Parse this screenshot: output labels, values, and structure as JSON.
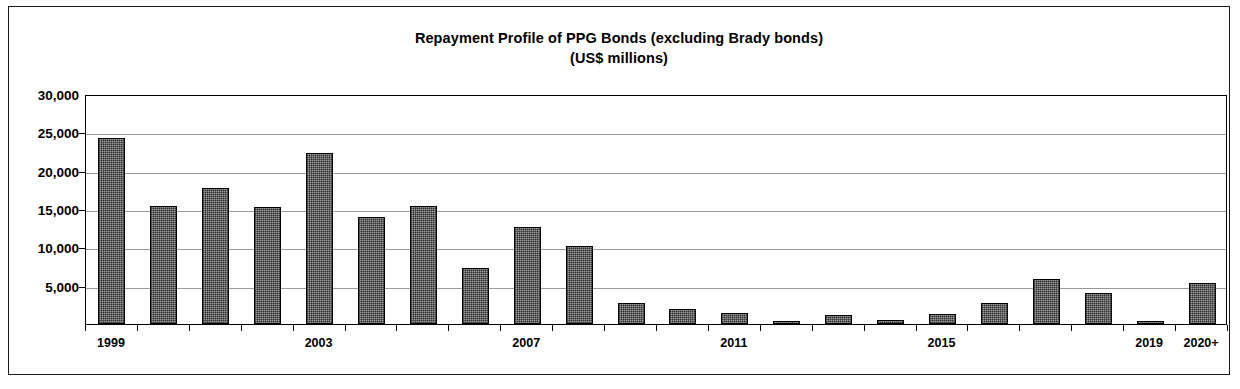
{
  "chart_data": {
    "type": "bar",
    "title": "Repayment Profile of PPG Bonds (excluding Brady bonds)",
    "subtitle": "(US$ millions)",
    "xlabel": "",
    "ylabel": "",
    "ylim": [
      0,
      30000
    ],
    "ytick_labels": [
      "30,000",
      "25,000",
      "20,000",
      "15,000",
      "10,000",
      "5,000"
    ],
    "ytick_values": [
      30000,
      25000,
      20000,
      15000,
      10000,
      5000
    ],
    "grid": true,
    "legend": false,
    "bar_color": "#9d9d9d",
    "bar_edge_color": "#000000",
    "categories": [
      "1999",
      "2000",
      "2001",
      "2002",
      "2003",
      "2004",
      "2005",
      "2006",
      "2007",
      "2008",
      "2009",
      "2010",
      "2011",
      "2012",
      "2013",
      "2014",
      "2015",
      "2016",
      "2017",
      "2018",
      "2019",
      "2020+"
    ],
    "values": [
      24300,
      15400,
      17700,
      15200,
      22300,
      13900,
      15400,
      7300,
      12600,
      10200,
      2800,
      1900,
      1400,
      400,
      1200,
      500,
      1300,
      2700,
      5900,
      4000,
      300,
      5300
    ],
    "xtick_labels": [
      "1999",
      "2003",
      "2007",
      "2011",
      "2015",
      "2019",
      "2020+"
    ],
    "xtick_categories": [
      "1999",
      "2003",
      "2007",
      "2011",
      "2015",
      "2019",
      "2020+"
    ]
  }
}
